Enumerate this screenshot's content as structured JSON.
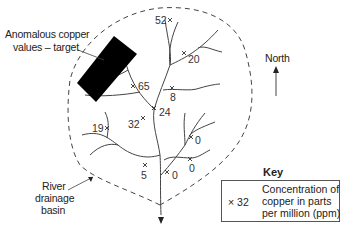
{
  "labels": {
    "target_line1": "Anomalous copper",
    "target_line2": "values – target",
    "basin_line1": "River",
    "basin_line2": "drainage",
    "basin_line3": "basin",
    "north": "North"
  },
  "samples": [
    {
      "value": "52"
    },
    {
      "value": "20"
    },
    {
      "value": "65"
    },
    {
      "value": "8"
    },
    {
      "value": "24"
    },
    {
      "value": "32"
    },
    {
      "value": "19"
    },
    {
      "value": "0"
    },
    {
      "value": "0"
    },
    {
      "value": "0"
    },
    {
      "value": "5"
    }
  ],
  "key": {
    "title": "Key",
    "symbol": "× 32",
    "desc_line1": "Concentration of",
    "desc_line2": "copper in parts",
    "desc_line3": "per million (ppm)"
  },
  "colors": {
    "line": "#444444",
    "target": "#000000"
  }
}
